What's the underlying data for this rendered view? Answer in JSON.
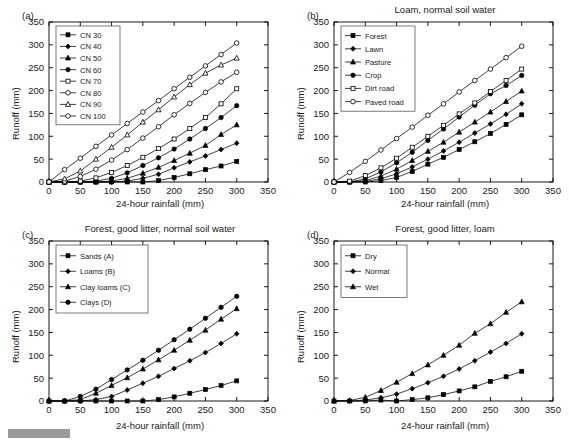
{
  "figure": {
    "background": "#ffffff",
    "line_color": "#000000",
    "marker_fill_open": "#ffffff",
    "artifact_bar_color": "#9a9a9a"
  },
  "axes": {
    "x_label": "24-hour rainfall (mm)",
    "y_label": "Runoff (mm)",
    "x_ticks": [
      0,
      50,
      100,
      150,
      200,
      250,
      300,
      350
    ],
    "y_ticks": [
      0,
      50,
      100,
      150,
      200,
      250,
      300,
      350
    ],
    "xlim": [
      0,
      350
    ],
    "ylim": [
      0,
      350
    ],
    "grid": false
  },
  "panels": [
    {
      "tag": "(a)",
      "title": "",
      "legend_position": "top-left",
      "chart_data": {
        "type": "line",
        "title": "",
        "xlabel": "24-hour rainfall (mm)",
        "ylabel": "Runoff (mm)",
        "xlim": [
          0,
          350
        ],
        "ylim": [
          0,
          350
        ],
        "grid": false,
        "x": [
          0,
          25,
          50,
          75,
          100,
          125,
          150,
          175,
          200,
          225,
          250,
          275,
          300
        ],
        "series": [
          {
            "name": "CN 30",
            "marker": "filled-square",
            "values": [
              0,
              0,
              0,
              0,
              0,
              0,
              0,
              3,
              10,
              18,
              27,
              35,
              45
            ]
          },
          {
            "name": "CN 40",
            "marker": "filled-diamond",
            "values": [
              0,
              0,
              0,
              0,
              0,
              2,
              8,
              17,
              31,
              44,
              57,
              71,
              85
            ]
          },
          {
            "name": "CN 50",
            "marker": "filled-triangle",
            "values": [
              0,
              0,
              0,
              0,
              2,
              8,
              19,
              32,
              47,
              63,
              80,
              104,
              125
            ]
          },
          {
            "name": "CN 60",
            "marker": "filled-circle",
            "values": [
              0,
              0,
              0,
              2,
              8,
              20,
              36,
              53,
              72,
              94,
              117,
              141,
              167
            ]
          },
          {
            "name": "CN 70",
            "marker": "open-square",
            "values": [
              0,
              0,
              2,
              9,
              21,
              36,
              54,
              73,
              94,
              117,
              141,
              171,
              204
            ]
          },
          {
            "name": "CN 80",
            "marker": "open-circle",
            "values": [
              0,
              2,
              12,
              28,
              48,
              71,
              96,
              121,
              147,
              172,
              196,
              219,
              240
            ]
          },
          {
            "name": "CN 90",
            "marker": "open-triangle",
            "values": [
              0,
              7,
              24,
              50,
              76,
              103,
              131,
              158,
              186,
              213,
              238,
              256,
              271
            ]
          },
          {
            "name": "CN 100",
            "marker": "open-circle",
            "values": [
              0,
              27,
              52,
              78,
              103,
              128,
              153,
              178,
              204,
              229,
              254,
              279,
              304
            ]
          }
        ]
      }
    },
    {
      "tag": "(b)",
      "title": "Loam, normal soil water",
      "legend_position": "top-left",
      "chart_data": {
        "type": "line",
        "title": "Loam, normal soil water",
        "xlabel": "24-hour rainfall (mm)",
        "ylabel": "Runoff (mm)",
        "xlim": [
          0,
          350
        ],
        "ylim": [
          0,
          350
        ],
        "grid": false,
        "x": [
          0,
          25,
          50,
          75,
          100,
          125,
          150,
          175,
          200,
          225,
          250,
          275,
          300
        ],
        "series": [
          {
            "name": "Forest",
            "marker": "filled-square",
            "values": [
              0,
              0,
              0,
              3,
              10,
              23,
              39,
              54,
              71,
              88,
              106,
              126,
              147
            ]
          },
          {
            "name": "Lawn",
            "marker": "filled-diamond",
            "values": [
              0,
              0,
              1,
              7,
              18,
              33,
              50,
              68,
              87,
              107,
              127,
              148,
              171
            ]
          },
          {
            "name": "Pasture",
            "marker": "filled-triangle",
            "values": [
              0,
              0,
              3,
              13,
              28,
              47,
              67,
              87,
              109,
              131,
              153,
              176,
              199
            ]
          },
          {
            "name": "Crop",
            "marker": "filled-circle",
            "values": [
              0,
              0,
              7,
              22,
              42,
              65,
              91,
              116,
              142,
              168,
              193,
              211,
              233
            ]
          },
          {
            "name": "Dirt road",
            "marker": "open-square",
            "values": [
              0,
              2,
              14,
              31,
              52,
              76,
              100,
              124,
              149,
              173,
              198,
              222,
              247
            ]
          },
          {
            "name": "Paved road",
            "marker": "open-circle",
            "values": [
              0,
              21,
              45,
              70,
              95,
              120,
              146,
              171,
              197,
              222,
              247,
              272,
              297
            ]
          }
        ]
      }
    },
    {
      "tag": "(c)",
      "title": "Forest, good litter, normal soil water",
      "legend_position": "top-left",
      "chart_data": {
        "type": "line",
        "title": "Forest, good litter, normal soil water",
        "xlabel": "24-hour rainfall (mm)",
        "ylabel": "Runoff (mm)",
        "xlim": [
          0,
          350
        ],
        "ylim": [
          0,
          350
        ],
        "grid": false,
        "x": [
          0,
          25,
          50,
          75,
          100,
          125,
          150,
          175,
          200,
          225,
          250,
          275,
          300
        ],
        "series": [
          {
            "name": "Sands (A)",
            "marker": "filled-square",
            "values": [
              0,
              0,
              0,
              0,
              0,
              0,
              0,
              3,
              9,
              17,
              25,
              34,
              44
            ]
          },
          {
            "name": "Loams (B)",
            "marker": "filled-diamond",
            "values": [
              0,
              0,
              0,
              3,
              10,
              24,
              39,
              54,
              71,
              88,
              106,
              126,
              147
            ]
          },
          {
            "name": "Clay loams (C)",
            "marker": "filled-triangle",
            "values": [
              0,
              0,
              3,
              17,
              34,
              51,
              70,
              90,
              111,
              133,
              155,
              179,
              202
            ]
          },
          {
            "name": "Clays (D)",
            "marker": "filled-circle",
            "values": [
              0,
              0,
              10,
              26,
              47,
              68,
              89,
              111,
              134,
              157,
              181,
              205,
              229
            ]
          }
        ]
      }
    },
    {
      "tag": "(d)",
      "title": "Forest, good litter, loam",
      "legend_position": "top-left",
      "chart_data": {
        "type": "line",
        "title": "Forest, good litter, loam",
        "xlabel": "24-hour rainfall (mm)",
        "ylabel": "Runoff (mm)",
        "xlim": [
          0,
          350
        ],
        "ylim": [
          0,
          350
        ],
        "grid": false,
        "x": [
          0,
          25,
          50,
          75,
          100,
          125,
          150,
          175,
          200,
          225,
          250,
          275,
          300
        ],
        "series": [
          {
            "name": "Dry",
            "marker": "filled-square",
            "values": [
              0,
              0,
              0,
              2,
              0,
              3,
              7,
              14,
              22,
              31,
              43,
              53,
              65
            ]
          },
          {
            "name": "Normal",
            "marker": "filled-diamond",
            "values": [
              0,
              0,
              2,
              7,
              15,
              27,
              40,
              54,
              70,
              88,
              107,
              126,
              147
            ]
          },
          {
            "name": "Wet",
            "marker": "filled-triangle",
            "values": [
              0,
              1,
              8,
              23,
              41,
              60,
              79,
              100,
              122,
              148,
              169,
              194,
              217
            ]
          }
        ]
      }
    }
  ]
}
